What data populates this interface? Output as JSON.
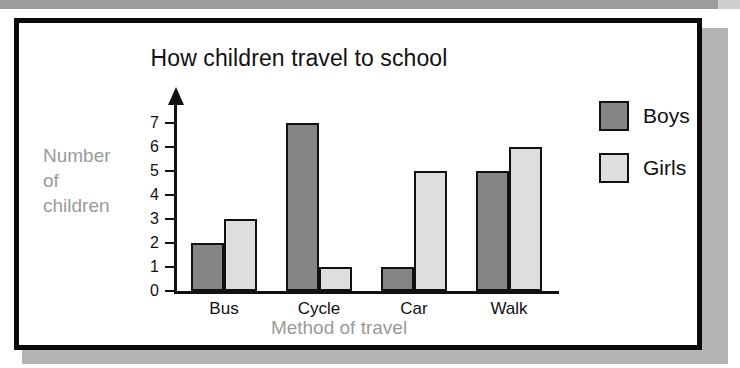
{
  "page": {
    "frame_color": "#0a0a0a",
    "shadow_color": "#b4b4b4",
    "top_strip_color": "#9d9d9d"
  },
  "chart_data": {
    "type": "bar",
    "title": "How children travel to school",
    "xlabel": "Method of travel",
    "ylabel": "Number of children",
    "ylabel_lines": [
      "Number",
      "of",
      "children"
    ],
    "categories": [
      "Bus",
      "Cycle",
      "Car",
      "Walk"
    ],
    "series": [
      {
        "name": "Boys",
        "color": "#858585",
        "values": [
          2,
          7,
          1,
          5
        ]
      },
      {
        "name": "Girls",
        "color": "#dedede",
        "values": [
          3,
          1,
          5,
          6
        ]
      }
    ],
    "ylim": [
      0,
      7
    ],
    "yticks": [
      0,
      1,
      2,
      3,
      4,
      5,
      6,
      7
    ],
    "ytick_labels": [
      "0",
      "1",
      "2",
      "3",
      "4",
      "5",
      "6",
      "7"
    ],
    "grid": false,
    "legend_position": "right",
    "y_axis_has_arrow": true
  }
}
